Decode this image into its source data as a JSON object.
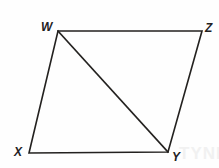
{
  "figure": {
    "kind": "geometry-diagram",
    "shape": "parallelogram-with-diagonal",
    "background_color": "#fefefe",
    "stroke_color": "#23211f",
    "stroke_width": 1.6,
    "label_color": "#23211f",
    "vertices": [
      {
        "id": "W",
        "label": "W",
        "x": 58,
        "y": 31
      },
      {
        "id": "Z",
        "label": "Z",
        "x": 202,
        "y": 31
      },
      {
        "id": "Y",
        "label": "Y",
        "x": 168,
        "y": 152
      },
      {
        "id": "X",
        "label": "X",
        "x": 29,
        "y": 153
      }
    ],
    "edges": [
      {
        "id": "WZ",
        "from": "W",
        "to": "Z"
      },
      {
        "id": "ZY",
        "from": "Z",
        "to": "Y"
      },
      {
        "id": "YX",
        "from": "Y",
        "to": "X"
      },
      {
        "id": "XW",
        "from": "X",
        "to": "W"
      }
    ],
    "diagonal": {
      "id": "WY",
      "from": "W",
      "to": "Y"
    },
    "labels": {
      "W": "W",
      "Z": "Z",
      "X": "X",
      "Y": "Y"
    },
    "watermark": "TYNE"
  }
}
